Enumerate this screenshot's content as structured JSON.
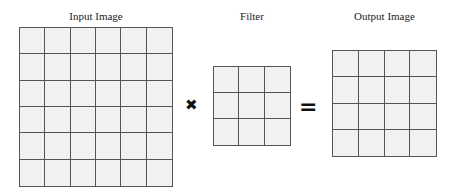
{
  "diagram": {
    "input": {
      "title": "Input Image",
      "rows": 6,
      "cols": 6
    },
    "operator_multiply": "✖",
    "filter": {
      "title": "Filter",
      "rows": 3,
      "cols": 3
    },
    "operator_equals": "=",
    "output": {
      "title": "Output Image",
      "rows": 4,
      "cols": 4
    }
  },
  "colors": {
    "cell_fill": "#f1f1f1",
    "grid_line": "#555555"
  }
}
